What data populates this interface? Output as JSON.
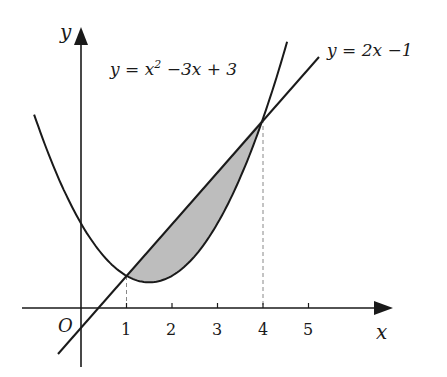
{
  "diagram": {
    "axes": {
      "x_label": "x",
      "y_label": "y",
      "origin_label": "O"
    },
    "x_ticks": [
      "1",
      "2",
      "3",
      "4",
      "5"
    ],
    "curves": [
      {
        "name": "parabola",
        "equation_prefix": "y = x",
        "equation_exp": "2",
        "equation_suffix": " −3x + 3"
      },
      {
        "name": "line",
        "equation": "y = 2x −1"
      }
    ],
    "intersections": [
      {
        "x": 1,
        "y": 1
      },
      {
        "x": 4,
        "y": 7
      }
    ],
    "shaded_region": "between y = 2x − 1 (above) and y = x² − 3x + 3 (below) for 1 ≤ x ≤ 4",
    "colors": {
      "stroke": "#1a1a1a",
      "shade": "#bdbdbd",
      "dash": "#888888"
    }
  }
}
